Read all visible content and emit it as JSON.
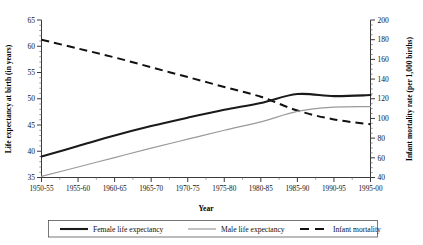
{
  "chart_data": {
    "type": "line",
    "title": "",
    "xlabel": "Year",
    "categories": [
      "1950-55",
      "1955-60",
      "1960-65",
      "1965-70",
      "1970-75",
      "1975-80",
      "1980-85",
      "1985-90",
      "1990-95",
      "1995-00"
    ],
    "grid": false,
    "legend_position": "bottom",
    "left_axis": {
      "label": "Life expectancy at birth (in years)",
      "ticks": [
        35,
        40,
        45,
        50,
        55,
        60,
        65
      ],
      "ylim": [
        35,
        65
      ],
      "minor_tick_step": 1
    },
    "right_axis": {
      "label": "Infant mortality rate (per 1,000 births)",
      "ticks": [
        40,
        60,
        80,
        100,
        120,
        140,
        160,
        180,
        200
      ],
      "ylim": [
        40,
        200
      ],
      "minor_tick_step": 5
    },
    "series": [
      {
        "name": "Female life expectancy",
        "axis": "left",
        "style": "solid-thick-black",
        "color": "#1a1a1a",
        "values": [
          39.0,
          41.0,
          43.0,
          44.8,
          46.4,
          47.9,
          49.2,
          50.9,
          50.5,
          50.7
        ]
      },
      {
        "name": "Male life expectancy",
        "axis": "left",
        "style": "solid-thin-gray",
        "color": "#9a9a9a",
        "values": [
          35.2,
          37.0,
          38.8,
          40.6,
          42.3,
          44.0,
          45.6,
          47.6,
          48.4,
          48.5
        ]
      },
      {
        "name": "Infant mortality",
        "axis": "right",
        "style": "dashed-black",
        "color": "#111111",
        "values": [
          180,
          171,
          162,
          152,
          142,
          132,
          122,
          108,
          99,
          94
        ]
      }
    ]
  },
  "legend": {
    "items": [
      {
        "label": "Female life expectancy",
        "key": "female"
      },
      {
        "label": "Male life expectancy",
        "key": "male"
      },
      {
        "label": "Infant mortality",
        "key": "infant"
      }
    ]
  },
  "ticklabels": {
    "left": [
      "65",
      "60",
      "55",
      "50",
      "45",
      "40",
      "35"
    ],
    "right": [
      "200",
      "180",
      "160",
      "140",
      "120",
      "100",
      "80",
      "60",
      "40"
    ],
    "x": [
      "1950-55",
      "1955-60",
      "1960-65",
      "1965-70",
      "1970-75",
      "1975-80",
      "1980-85",
      "1985-90",
      "1990-95",
      "1995-00"
    ]
  },
  "axis_titles": {
    "left": "Life expectancy at birth (in years)",
    "right": "Infant mortality rate (per 1,000 births)",
    "x": "Year"
  }
}
